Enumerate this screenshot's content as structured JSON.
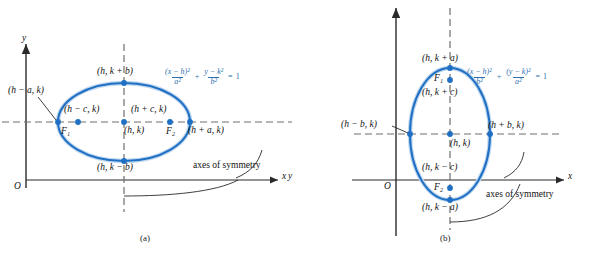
{
  "figure": {
    "accent_color": "#1f6fc4",
    "equation_color": "#2f6fb0",
    "axis_color": "#2a2a2a",
    "dash_color": "#6f6f6f"
  },
  "panel_a": {
    "caption": "(a)",
    "axis_y_label": "y",
    "axis_x_label": "x",
    "origin_label": "O",
    "symmetry_note": "axes of symmetry",
    "equation": {
      "num1": "(x − h)²",
      "den1": "a²",
      "plus": "+",
      "num2": "y − k²",
      "den2": "b²",
      "equals": "=",
      "one": "1"
    },
    "points": {
      "top": "(h, k + b)",
      "bottom": "(h, k − b)",
      "left_vertex": "(h − a, k)",
      "right_vertex": "(h + a, k)",
      "left_focus_coord": "(h − c, k)",
      "right_focus_coord": "(h + c, k)",
      "center": "(h, k)",
      "focus1": "F₁",
      "focus2": "F₂"
    }
  },
  "panel_b": {
    "caption": "(b)",
    "axis_y_label": "y",
    "axis_x_label": "x",
    "origin_label": "O",
    "symmetry_note": "axes of symmetry",
    "equation": {
      "num1": "(x − h)²",
      "den1": "b²",
      "plus": "+",
      "num2": "(y − k)²",
      "den2": "a²",
      "equals": "=",
      "one": "1"
    },
    "points": {
      "top": "(h, k + a)",
      "bottom": "(h, k − a)",
      "left_vertex": "(h − b, k)",
      "right_vertex": "(h + b, k)",
      "upper_focus_coord": "(h, k + c)",
      "lower_focus_coord": "(h, k − c)",
      "center": "(h, k)",
      "focus1": "F₁",
      "focus2": "F₂"
    }
  }
}
